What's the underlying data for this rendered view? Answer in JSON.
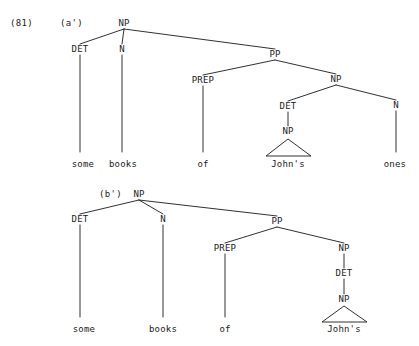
{
  "figure": {
    "example_number": "(81)",
    "width": 419,
    "height": 346,
    "ink_color": "#1a1a1a",
    "background_color": "#ffffff"
  },
  "trees": [
    {
      "id": "tree-a-prime",
      "label": "(a')",
      "label_x": 60,
      "label_y": 26,
      "example_number_x": 10,
      "example_number_y": 26,
      "nodes": [
        {
          "name": "np-root",
          "text": "NP",
          "x": 124,
          "y": 26
        },
        {
          "name": "det",
          "text": "DET",
          "x": 80,
          "y": 52
        },
        {
          "name": "n",
          "text": "N",
          "x": 122,
          "y": 52
        },
        {
          "name": "pp",
          "text": "PP",
          "x": 275,
          "y": 57
        },
        {
          "name": "prep",
          "text": "PREP",
          "x": 203,
          "y": 83
        },
        {
          "name": "np-object",
          "text": "NP",
          "x": 336,
          "y": 82
        },
        {
          "name": "det-possessive",
          "text": "DET",
          "x": 288,
          "y": 109
        },
        {
          "name": "np-possessor",
          "text": "NP",
          "x": 288,
          "y": 134
        },
        {
          "name": "n-ones",
          "text": "N",
          "x": 396,
          "y": 108
        }
      ],
      "edges": [
        {
          "name": "edge-np-det",
          "x1": 124,
          "y1": 29,
          "x2": 80,
          "y2": 44
        },
        {
          "name": "edge-np-n",
          "x1": 124,
          "y1": 29,
          "x2": 122,
          "y2": 44
        },
        {
          "name": "edge-np-pp",
          "x1": 124,
          "y1": 29,
          "x2": 275,
          "y2": 49
        },
        {
          "name": "edge-pp-prep",
          "x1": 275,
          "y1": 60,
          "x2": 203,
          "y2": 75
        },
        {
          "name": "edge-pp-np",
          "x1": 275,
          "y1": 60,
          "x2": 336,
          "y2": 74
        },
        {
          "name": "edge-np-det2",
          "x1": 336,
          "y1": 85,
          "x2": 288,
          "y2": 101
        },
        {
          "name": "edge-np-n2",
          "x1": 336,
          "y1": 85,
          "x2": 396,
          "y2": 100
        },
        {
          "name": "edge-det-np3",
          "x1": 288,
          "y1": 112,
          "x2": 288,
          "y2": 126
        },
        {
          "name": "edge-det-some",
          "x1": 80,
          "y1": 55,
          "x2": 80,
          "y2": 152
        },
        {
          "name": "edge-n-books",
          "x1": 122,
          "y1": 55,
          "x2": 122,
          "y2": 152
        },
        {
          "name": "edge-prep-of",
          "x1": 203,
          "y1": 86,
          "x2": 203,
          "y2": 152
        },
        {
          "name": "edge-n-ones",
          "x1": 396,
          "y1": 111,
          "x2": 396,
          "y2": 152
        }
      ],
      "triangles": [
        {
          "name": "triangle-johns",
          "apex_x": 288,
          "apex_y": 139,
          "left_x": 266,
          "right_x": 311,
          "base_y": 156
        }
      ],
      "terminals": [
        {
          "name": "terminal-some",
          "text": "some",
          "x": 83,
          "y": 167
        },
        {
          "name": "terminal-books",
          "text": "books",
          "x": 123,
          "y": 167
        },
        {
          "name": "terminal-of",
          "text": "of",
          "x": 203,
          "y": 167
        },
        {
          "name": "terminal-johns",
          "text": "John's",
          "x": 288,
          "y": 167
        },
        {
          "name": "terminal-ones",
          "text": "ones",
          "x": 395,
          "y": 167
        }
      ]
    },
    {
      "id": "tree-b-prime",
      "label": "(b')",
      "label_x": 99,
      "label_y": 197,
      "nodes": [
        {
          "name": "np-root",
          "text": "NP",
          "x": 139,
          "y": 197
        },
        {
          "name": "det",
          "text": "DET",
          "x": 80,
          "y": 222
        },
        {
          "name": "n",
          "text": "N",
          "x": 163,
          "y": 222
        },
        {
          "name": "pp",
          "text": "PP",
          "x": 277,
          "y": 224
        },
        {
          "name": "prep",
          "text": "PREP",
          "x": 225,
          "y": 251
        },
        {
          "name": "np-object",
          "text": "NP",
          "x": 344,
          "y": 251
        },
        {
          "name": "det-possessive",
          "text": "DET",
          "x": 344,
          "y": 276
        },
        {
          "name": "np-possessor",
          "text": "NP",
          "x": 344,
          "y": 302
        }
      ],
      "edges": [
        {
          "name": "edge-np-det",
          "x1": 139,
          "y1": 200,
          "x2": 80,
          "y2": 214
        },
        {
          "name": "edge-np-n",
          "x1": 139,
          "y1": 200,
          "x2": 163,
          "y2": 214
        },
        {
          "name": "edge-np-pp",
          "x1": 139,
          "y1": 200,
          "x2": 277,
          "y2": 216
        },
        {
          "name": "edge-pp-prep",
          "x1": 277,
          "y1": 227,
          "x2": 225,
          "y2": 243
        },
        {
          "name": "edge-pp-np",
          "x1": 277,
          "y1": 227,
          "x2": 344,
          "y2": 243
        },
        {
          "name": "edge-np-det2",
          "x1": 344,
          "y1": 254,
          "x2": 344,
          "y2": 268
        },
        {
          "name": "edge-det-np3",
          "x1": 344,
          "y1": 279,
          "x2": 344,
          "y2": 294
        },
        {
          "name": "edge-det-some",
          "x1": 80,
          "y1": 225,
          "x2": 80,
          "y2": 317
        },
        {
          "name": "edge-n-books",
          "x1": 163,
          "y1": 225,
          "x2": 163,
          "y2": 317
        },
        {
          "name": "edge-prep-of",
          "x1": 225,
          "y1": 254,
          "x2": 225,
          "y2": 317
        }
      ],
      "triangles": [
        {
          "name": "triangle-johns",
          "apex_x": 344,
          "apex_y": 306,
          "left_x": 322,
          "right_x": 367,
          "base_y": 322
        }
      ],
      "terminals": [
        {
          "name": "terminal-some",
          "text": "some",
          "x": 84,
          "y": 332
        },
        {
          "name": "terminal-books",
          "text": "books",
          "x": 163,
          "y": 332
        },
        {
          "name": "terminal-of",
          "text": "of",
          "x": 225,
          "y": 332
        },
        {
          "name": "terminal-johns",
          "text": "John's",
          "x": 344,
          "y": 332
        }
      ]
    }
  ]
}
